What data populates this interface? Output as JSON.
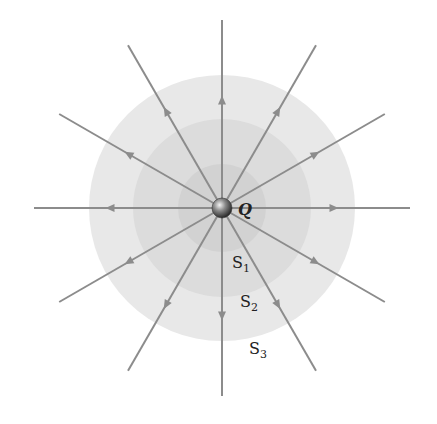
{
  "diagram": {
    "charge_label": "Q",
    "surfaces": [
      {
        "label": "S",
        "sub": "1",
        "radius": 44,
        "color": "#d2d2d2"
      },
      {
        "label": "S",
        "sub": "2",
        "radius": 89,
        "color": "#dcdcdc"
      },
      {
        "label": "S",
        "sub": "3",
        "radius": 133,
        "color": "#e8e8e8"
      }
    ],
    "field_lines": {
      "count": 12,
      "direction": "outward",
      "length": 188,
      "color": "#8c8c8c"
    },
    "center": {
      "x": 222,
      "y": 208
    },
    "charge_color": "#555555"
  }
}
